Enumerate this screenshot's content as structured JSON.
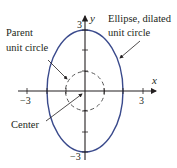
{
  "diagram": {
    "axes": {
      "x_label": "x",
      "y_label": "y",
      "x_ticks": [
        {
          "label": "−3",
          "value": -3
        },
        {
          "label": "3",
          "value": 3
        }
      ],
      "y_ticks": [
        {
          "label": "3",
          "value": 3
        },
        {
          "label": "−3",
          "value": -3
        }
      ]
    },
    "shapes": {
      "parent_circle": {
        "type": "circle",
        "center": [
          0,
          0
        ],
        "radius": 1,
        "style": "dashed"
      },
      "ellipse": {
        "type": "ellipse",
        "center": [
          0,
          0
        ],
        "rx": 2,
        "ry": 3,
        "style": "solid"
      }
    },
    "annotations": {
      "parent_line1": "Parent",
      "parent_line2": "unit circle",
      "ellipse_line1": "Ellipse, dilated",
      "ellipse_line2": "unit circle",
      "center": "Center"
    },
    "colors": {
      "ellipse": "#3a4a8c",
      "axes": "#231f20",
      "dashed_circle": "#555555"
    }
  }
}
